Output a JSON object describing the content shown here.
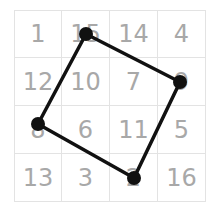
{
  "grid": {
    "rows": [
      [
        "1",
        "15",
        "14",
        "4"
      ],
      [
        "12",
        "10",
        "7",
        "9"
      ],
      [
        "8",
        "6",
        "11",
        "5"
      ],
      [
        "13",
        "3",
        "2",
        "16"
      ]
    ]
  },
  "polygon": {
    "points": [
      [
        86,
        34
      ],
      [
        180,
        82
      ],
      [
        134,
        178
      ],
      [
        38,
        124
      ]
    ],
    "color": "#111111"
  }
}
